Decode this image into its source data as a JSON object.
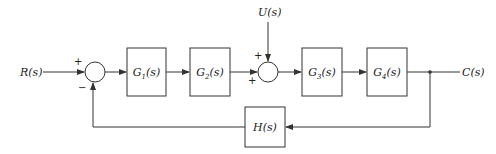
{
  "diagram": {
    "type": "block-diagram",
    "input": {
      "label": "R(s)"
    },
    "disturbance": {
      "label": "U(s)"
    },
    "output": {
      "label": "C(s)"
    },
    "blocks": [
      {
        "id": "G1",
        "name": "G",
        "sub": "1",
        "arg": "(s)"
      },
      {
        "id": "G2",
        "name": "G",
        "sub": "2",
        "arg": "(s)"
      },
      {
        "id": "G3",
        "name": "G",
        "sub": "3",
        "arg": "(s)"
      },
      {
        "id": "G4",
        "name": "G",
        "sub": "4",
        "arg": "(s)"
      },
      {
        "id": "H",
        "name": "H",
        "sub": "",
        "arg": "(s)"
      }
    ],
    "summing_junctions": [
      {
        "id": "S1",
        "signs": {
          "top_left": "+",
          "bottom_left": "−"
        }
      },
      {
        "id": "S2",
        "signs": {
          "top": "+",
          "left": "+"
        }
      }
    ],
    "connections": [
      "R(s) → S1(+)",
      "S1 → G1(s)",
      "G1(s) → G2(s)",
      "G2(s) → S2(+)",
      "U(s) → S2(+)",
      "S2 → G3(s)",
      "G3(s) → G4(s)",
      "G4(s) → C(s)",
      "C(s) → H(s)",
      "H(s) → S1(−)"
    ]
  }
}
